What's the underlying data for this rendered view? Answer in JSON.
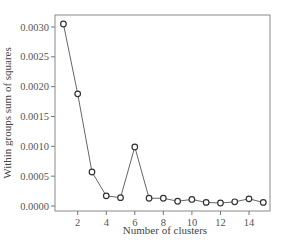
{
  "chart_data": {
    "type": "line",
    "title": "",
    "xlabel": "Number of clusters",
    "ylabel": "Within groups sum of squares",
    "x": [
      1,
      2,
      3,
      4,
      5,
      6,
      7,
      8,
      9,
      10,
      11,
      12,
      13,
      14,
      15
    ],
    "series": [
      {
        "name": "WSS",
        "values": [
          0.00305,
          0.00188,
          0.00057,
          0.00017,
          0.00014,
          0.00099,
          0.00013,
          0.00013,
          8e-05,
          0.00011,
          6e-05,
          5e-05,
          7e-05,
          0.00012,
          6e-05
        ]
      }
    ],
    "xticks": [
      2,
      4,
      6,
      8,
      10,
      12,
      14
    ],
    "yticks": [
      "0.0000",
      "0.0005",
      "0.0010",
      "0.0015",
      "0.0020",
      "0.0025",
      "0.0030"
    ],
    "xlim": [
      0.6,
      15.5
    ],
    "ylim": [
      -8e-05,
      0.0032
    ],
    "grid": false,
    "legend": "none",
    "marker": "open-circle",
    "line_color": "#666666"
  }
}
